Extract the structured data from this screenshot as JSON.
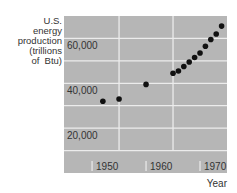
{
  "chart_data": {
    "type": "scatter",
    "title": "",
    "ylabel_lines": [
      "U.S.",
      "energy",
      "production",
      "(trillions",
      "of  Btu)"
    ],
    "xlabel": "Year",
    "xlim": [
      1944.8,
      1975
    ],
    "ylim": [
      0,
      70000
    ],
    "x_ticks": [
      1950,
      1960,
      1970
    ],
    "x_tick_labels": [
      "1950",
      "1960",
      "1970"
    ],
    "x_gridlines": [
      1955,
      1965
    ],
    "y_gridlines": [
      10000,
      20000,
      30000,
      40000,
      50000,
      60000
    ],
    "y_tick_labels": [
      {
        "value": 60000,
        "label": "60,000"
      },
      {
        "value": 40000,
        "label": "40,000"
      },
      {
        "value": 20000,
        "label": "20,000"
      }
    ],
    "grid": true,
    "legend": "none",
    "series": [
      {
        "name": "U.S. energy production",
        "points": [
          {
            "x": 1952,
            "y": 32000
          },
          {
            "x": 1955,
            "y": 33000
          },
          {
            "x": 1960,
            "y": 39500
          },
          {
            "x": 1965,
            "y": 44500
          },
          {
            "x": 1966,
            "y": 45500
          },
          {
            "x": 1967,
            "y": 47500
          },
          {
            "x": 1968,
            "y": 49500
          },
          {
            "x": 1969,
            "y": 51500
          },
          {
            "x": 1970,
            "y": 53500
          },
          {
            "x": 1971,
            "y": 56500
          },
          {
            "x": 1972,
            "y": 59500
          },
          {
            "x": 1973,
            "y": 62000
          },
          {
            "x": 1974,
            "y": 65500
          }
        ]
      }
    ],
    "colors": {
      "panel": "#b6b6b6",
      "gridline": "#ececec",
      "marker": "#111111"
    }
  }
}
